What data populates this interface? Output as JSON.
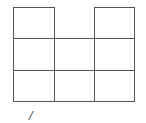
{
  "diagram": {
    "line_color": "#555555",
    "columns_x": [
      13,
      54,
      94,
      134
    ],
    "rows_y": [
      7,
      38,
      70,
      101
    ],
    "cells_present": [
      [
        true,
        false,
        true
      ],
      [
        true,
        true,
        true
      ],
      [
        true,
        true,
        true
      ]
    ]
  },
  "mark": {
    "text": "/"
  }
}
